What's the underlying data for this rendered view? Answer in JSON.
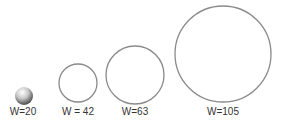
{
  "figure": {
    "items": [
      {
        "label": "W=20",
        "shape": "sphere",
        "cx": 24,
        "cy": 96,
        "r": 9
      },
      {
        "label": "W = 42",
        "shape": "circle",
        "cx": 78,
        "cy": 83,
        "r": 19
      },
      {
        "label": "W=63",
        "shape": "circle",
        "cx": 135,
        "cy": 75,
        "r": 29
      },
      {
        "label": "W=105",
        "shape": "circle",
        "cx": 223,
        "cy": 54,
        "r": 48
      }
    ],
    "stroke_color": "#8a8a8a"
  }
}
